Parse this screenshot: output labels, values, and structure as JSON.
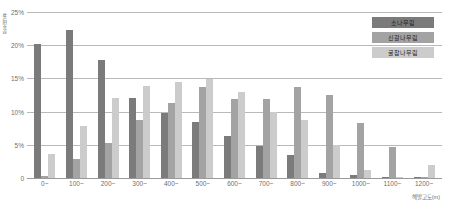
{
  "chart_data": {
    "type": "bar",
    "title": "",
    "xlabel": "해발고도(m)",
    "ylabel": "분포비율",
    "ylim": [
      0,
      25
    ],
    "yticks": [
      "0",
      "5%",
      "10%",
      "15%",
      "20%",
      "25%"
    ],
    "ytick_values": [
      0,
      5,
      10,
      15,
      20,
      25
    ],
    "grid": true,
    "legend_position": "top-right",
    "categories": [
      "0~",
      "100~",
      "200~",
      "300~",
      "400~",
      "500~",
      "600~",
      "700~",
      "800~",
      "900~",
      "1000~",
      "1100~",
      "1200~"
    ],
    "series": [
      {
        "name": "소나무림",
        "color": "#7b7b7b",
        "values": [
          20.2,
          22.3,
          17.8,
          12.1,
          9.8,
          8.5,
          6.4,
          4.8,
          3.5,
          0.8,
          0.4,
          0.2,
          0.2
        ]
      },
      {
        "name": "신갈나무림",
        "color": "#a3a3a3",
        "values": [
          0.3,
          2.8,
          5.3,
          8.7,
          11.3,
          13.7,
          11.9,
          11.9,
          13.7,
          12.5,
          8.3,
          4.6,
          0.1
        ]
      },
      {
        "name": "굴참나무림",
        "color": "#cccccc",
        "values": [
          3.6,
          7.9,
          12.1,
          13.9,
          14.5,
          14.9,
          12.9,
          10.0,
          8.7,
          5.0,
          1.2,
          0.1,
          2.0
        ]
      }
    ]
  },
  "legend": {
    "items": [
      {
        "label": "소나무림"
      },
      {
        "label": "신갈나무림"
      },
      {
        "label": "굴참나무림"
      }
    ]
  }
}
